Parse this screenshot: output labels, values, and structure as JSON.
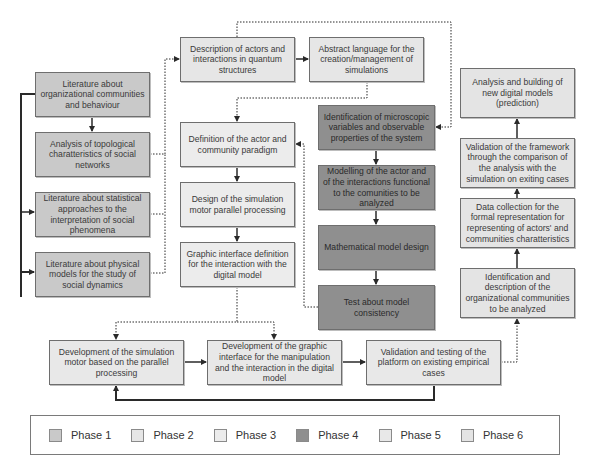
{
  "diagram": {
    "phase_colors": {
      "phase1": "#c9c9c9",
      "phase2": "#e6e6e6",
      "phase3": "#ececec",
      "phase4": "#8f8f8f",
      "phase5": "#e8e8e8",
      "phase6": "#e4e4e4"
    },
    "left_column": [
      {
        "id": "lit-org",
        "phase": 1,
        "label": "Literature about organizational communities and behaviour"
      },
      {
        "id": "topology",
        "phase": 1,
        "label": "Analysis of topological charatteristics of social networks"
      },
      {
        "id": "lit-stat",
        "phase": 1,
        "label": "Literature about statistical approaches to the interpretation of social phenomena"
      },
      {
        "id": "lit-phys",
        "phase": 1,
        "label": "Literature about physical models for the study of social dynamics"
      }
    ],
    "top_row": [
      {
        "id": "quantum",
        "phase": 2,
        "label": "Description of actors and interactions in quantum structures"
      },
      {
        "id": "abstract-lang",
        "phase": 2,
        "label": "Abstract language for the creation/management of simulations"
      }
    ],
    "center_column": [
      {
        "id": "actor-paradigm",
        "phase": 3,
        "label": "Definition of the actor and community paradigm"
      },
      {
        "id": "sim-design",
        "phase": 3,
        "label": "Design of the simulation motor parallel processing"
      },
      {
        "id": "gui-def",
        "phase": 3,
        "label": "Graphic interface definition for the interaction with the digital model"
      }
    ],
    "math_column": [
      {
        "id": "micro-vars",
        "phase": 4,
        "label": "Identification of microscopic variables  and observable properties of the system"
      },
      {
        "id": "modelling",
        "phase": 4,
        "label": "Modelling of the actor and of the interactions functional to the comunities to be analyzed"
      },
      {
        "id": "math-model",
        "phase": 4,
        "label": "Mathematical model design"
      },
      {
        "id": "consistency",
        "phase": 4,
        "label": "Test about model consistency"
      }
    ],
    "right_column": [
      {
        "id": "prediction",
        "phase": 6,
        "label": "Analysis and building of new digital models (prediction)"
      },
      {
        "id": "validation-framework",
        "phase": 6,
        "label": "Validation of the framework through the comparison of the analysis with the simulation on exiting cases"
      },
      {
        "id": "data-collection",
        "phase": 6,
        "label": "Data collection for the formal representation for representing of actors' and communities charatteristics"
      },
      {
        "id": "identify-communities",
        "phase": 6,
        "label": "Identification and description of the organizational communities to be analyzed"
      }
    ],
    "bottom_row": [
      {
        "id": "dev-sim",
        "phase": 5,
        "label": "Development of the simulation motor based on the parallel processing"
      },
      {
        "id": "dev-gui",
        "phase": 5,
        "label": "Development of the graphic interface for the manipulation and the interaction in the digital model"
      },
      {
        "id": "validation-testing",
        "phase": 5,
        "label": "Validation and testing of the platform on existing empirical cases"
      }
    ],
    "edges": [
      {
        "from": "lit-org",
        "to": "topology",
        "style": "solid"
      },
      {
        "from": "lit-org",
        "to": "lit-stat",
        "style": "solid"
      },
      {
        "from": "lit-org",
        "to": "lit-phys",
        "style": "solid"
      },
      {
        "from": "topology",
        "to": "quantum",
        "style": "dotted"
      },
      {
        "from": "lit-stat",
        "to": "quantum",
        "style": "dotted"
      },
      {
        "from": "lit-phys",
        "to": "quantum",
        "style": "dotted"
      },
      {
        "from": "quantum",
        "to": "abstract-lang",
        "style": "solid"
      },
      {
        "from": "quantum",
        "to": "micro-vars",
        "style": "dotted"
      },
      {
        "from": "abstract-lang",
        "to": "actor-paradigm",
        "style": "dotted"
      },
      {
        "from": "actor-paradigm",
        "to": "sim-design",
        "style": "solid"
      },
      {
        "from": "sim-design",
        "to": "gui-def",
        "style": "solid"
      },
      {
        "from": "micro-vars",
        "to": "modelling",
        "style": "solid"
      },
      {
        "from": "modelling",
        "to": "math-model",
        "style": "solid"
      },
      {
        "from": "math-model",
        "to": "consistency",
        "style": "solid"
      },
      {
        "from": "consistency",
        "to": "actor-paradigm",
        "style": "dotted"
      },
      {
        "from": "gui-def",
        "to": "dev-sim",
        "style": "dotted"
      },
      {
        "from": "gui-def",
        "to": "dev-gui",
        "style": "dotted"
      },
      {
        "from": "dev-sim",
        "to": "dev-gui",
        "style": "solid"
      },
      {
        "from": "dev-gui",
        "to": "validation-testing",
        "style": "solid"
      },
      {
        "from": "validation-testing",
        "to": "dev-sim",
        "style": "solid"
      },
      {
        "from": "validation-testing",
        "to": "identify-communities",
        "style": "dotted"
      },
      {
        "from": "identify-communities",
        "to": "data-collection",
        "style": "solid"
      },
      {
        "from": "data-collection",
        "to": "validation-framework",
        "style": "solid"
      },
      {
        "from": "validation-framework",
        "to": "prediction",
        "style": "solid"
      }
    ]
  },
  "legend": {
    "items": [
      {
        "label": "Phase 1",
        "color": "#c9c9c9"
      },
      {
        "label": "Phase 2",
        "color": "#e6e6e6"
      },
      {
        "label": "Phase 3",
        "color": "#ececec"
      },
      {
        "label": "Phase 4",
        "color": "#8f8f8f"
      },
      {
        "label": "Phase 5",
        "color": "#e8e8e8"
      },
      {
        "label": "Phase 6",
        "color": "#e4e4e4"
      }
    ]
  }
}
